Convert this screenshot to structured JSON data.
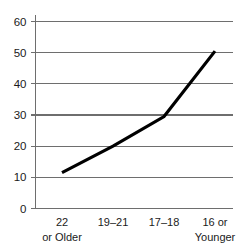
{
  "chart_data": {
    "type": "line",
    "title": "",
    "subtitle": "",
    "xlabel": "",
    "ylabel": "",
    "categories": [
      "22\nor Older",
      "19–21",
      "17–18",
      "16 or\nYounger"
    ],
    "category_lines": [
      [
        "22",
        "or Older"
      ],
      [
        "19–21",
        ""
      ],
      [
        "17–18",
        ""
      ],
      [
        "16 or",
        "Younger"
      ]
    ],
    "values": [
      11.5,
      20,
      29.5,
      50.5
    ],
    "series": [
      {
        "name": "",
        "values": [
          11.5,
          20,
          29.5,
          50.5
        ]
      }
    ],
    "ylim": [
      0,
      60
    ],
    "ytick_values": [
      0,
      10,
      20,
      30,
      40,
      50,
      60
    ],
    "ytick_labels": [
      "0",
      "10",
      "20",
      "30",
      "40",
      "50",
      "60"
    ],
    "grid": true,
    "grid_axis": "y",
    "legend": false,
    "legend_position": "none",
    "markers": false,
    "annotations": []
  },
  "style": {
    "background": "#ffffff",
    "line_color": "#000000",
    "line_width": 3.2,
    "grid_color": "#6e6e6e",
    "axis_color": "#6e6e6e",
    "tick_color": "#6e6e6e",
    "text_color": "#1a1a1a"
  }
}
